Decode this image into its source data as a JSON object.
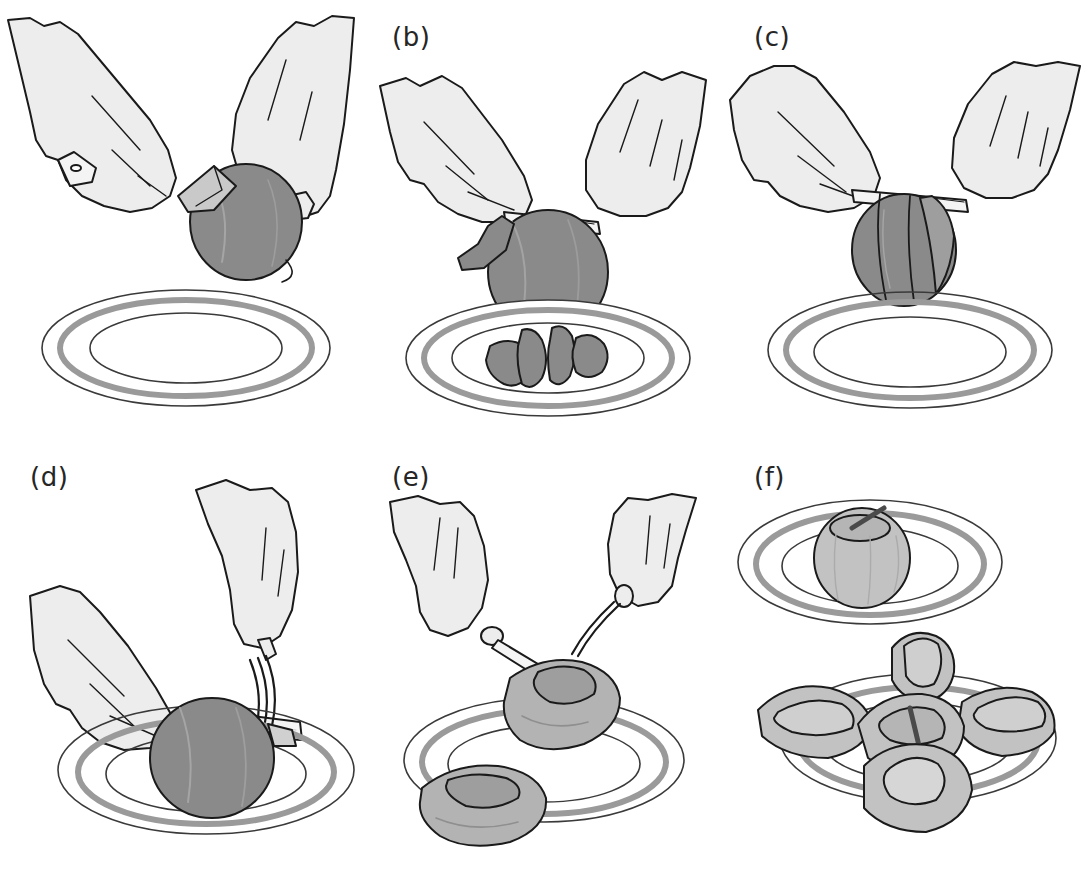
{
  "figure": {
    "style": "grayscale technical line drawing",
    "panel_count": 6,
    "columns": 3,
    "rows": 2
  },
  "palette": {
    "background": "#ffffff",
    "outline": "#1a1a1a",
    "skin_fill": "#ededed",
    "skin_shadow": "#dcdcdc",
    "fruit_dark": "#8a8a8a",
    "fruit_dark_shade": "#757575",
    "fruit_light": "#c2c2c2",
    "fruit_light_shade": "#ababab",
    "flesh_light": "#d6d6d6",
    "plate_band": "#9a9a9a",
    "plate_line": "#3a3a3a",
    "blade_fill": "#f4f4f4",
    "handle_dark": "#1a1a1a",
    "core_dark": "#555555"
  },
  "panels": [
    {
      "id": "a",
      "label": "(a)",
      "caption_text": "Peeling the fruit with a swivel peeler held in the left hand while the right hand grips the fruit",
      "objects": [
        "left-hand",
        "right-hand",
        "peeler",
        "whole-fruit",
        "empty-plate"
      ],
      "fruit_state": "whole, unpeeled",
      "fruit_tone": "#8a8a8a",
      "plate_contents": "empty",
      "tool": "peeler"
    },
    {
      "id": "b",
      "label": "(b)",
      "caption_text": "Continuing to peel; removed peel strips collect on the plate below",
      "objects": [
        "left-hand",
        "right-hand",
        "peeler",
        "whole-fruit",
        "peel-strips",
        "plate"
      ],
      "fruit_state": "partly peeled",
      "fruit_tone": "#8a8a8a",
      "plate_contents": "four peel strips",
      "peel_strip_count": 4,
      "tool": "peeler"
    },
    {
      "id": "c",
      "label": "(c)",
      "caption_text": "Final peel strips are drawn off the fruit, which is held above the plate",
      "objects": [
        "left-hand",
        "right-hand",
        "peeler",
        "partly-peeled-fruit",
        "empty-plate"
      ],
      "fruit_state": "mostly peeled with remaining strips",
      "fruit_tone": "#8a8a8a",
      "plate_contents": "empty",
      "tool": "peeler"
    },
    {
      "id": "d",
      "label": "(d)",
      "caption_text": "Holding the fruit with a fork, a knife cuts it horizontally on the plate",
      "objects": [
        "left-hand",
        "right-hand",
        "knife",
        "fork",
        "peeled-fruit",
        "plate"
      ],
      "fruit_state": "peeled whole, being halved",
      "fruit_tone": "#8a8a8a",
      "plate_contents": "fruit being cut",
      "tool": "knife and fork"
    },
    {
      "id": "e",
      "label": "(e)",
      "caption_text": "The core is removed from each half with knife and fork",
      "objects": [
        "left-hand",
        "right-hand",
        "knife",
        "fork",
        "fruit-half-cored",
        "fruit-half",
        "plate"
      ],
      "fruit_state": "halved, core being removed",
      "fruit_tone": "#b3b3b3",
      "plate_contents": "two halves",
      "tool": "knife and fork"
    },
    {
      "id": "f",
      "label": "(f)",
      "caption_text": "Result: whole cored fruit on the upper plate and quartered pieces arranged on the lower plate",
      "objects": [
        "upper-plate",
        "cored-whole-fruit",
        "lower-plate",
        "fruit-quarters"
      ],
      "fruit_state": "cored whole and quartered",
      "fruit_tone": "#c2c2c2",
      "plate_contents": "cored whole fruit (upper plate); five arranged quarters (lower plate)",
      "quarter_count": 5,
      "plate_count": 2,
      "tool": "none"
    }
  ],
  "caption": ""
}
